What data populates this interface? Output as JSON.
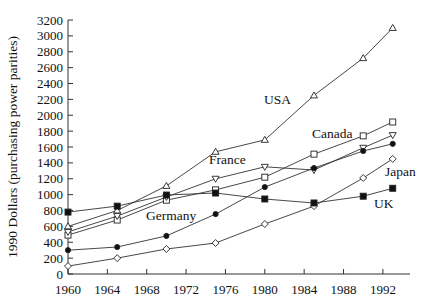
{
  "chart_data": {
    "type": "line",
    "title": "",
    "xlabel": "",
    "ylabel": "1990 Dollars (purchasing power parities)",
    "xlim": [
      1960,
      1995
    ],
    "ylim": [
      0,
      3200
    ],
    "x_ticks": [
      1960,
      1964,
      1968,
      1972,
      1976,
      1980,
      1984,
      1988,
      1992
    ],
    "y_ticks": [
      0,
      200,
      400,
      600,
      800,
      1000,
      1200,
      1400,
      1600,
      1800,
      2000,
      2200,
      2400,
      2600,
      2800,
      3000,
      3200
    ],
    "grid": false,
    "legend": "inline labels",
    "x": [
      1960,
      1965,
      1970,
      1975,
      1980,
      1985,
      1990,
      1993
    ],
    "series": [
      {
        "name": "USA",
        "marker": "open-triangle-up",
        "values": [
          600,
          800,
          1110,
          1540,
          1690,
          2250,
          2720,
          3100
        ],
        "label_pos": [
          264,
          104
        ]
      },
      {
        "name": "Canada",
        "marker": "open-square",
        "values": [
          490,
          680,
          930,
          1060,
          1220,
          1510,
          1740,
          1915
        ],
        "label_pos": [
          312,
          138
        ]
      },
      {
        "name": "France",
        "marker": "open-triangle-down",
        "values": [
          530,
          730,
          970,
          1200,
          1350,
          1310,
          1590,
          1750
        ],
        "label_pos": [
          209,
          164
        ]
      },
      {
        "name": "Germany",
        "marker": "filled-circle",
        "values": [
          300,
          340,
          480,
          755,
          1095,
          1335,
          1550,
          1640
        ],
        "label_pos": [
          146,
          220
        ]
      },
      {
        "name": "Japan",
        "marker": "open-diamond",
        "values": [
          100,
          200,
          315,
          390,
          630,
          855,
          1210,
          1450
        ],
        "label_pos": [
          385,
          176
        ]
      },
      {
        "name": "UK",
        "marker": "filled-square",
        "values": [
          780,
          855,
          995,
          1020,
          945,
          895,
          980,
          1080
        ],
        "label_pos": [
          374,
          208
        ]
      }
    ]
  }
}
